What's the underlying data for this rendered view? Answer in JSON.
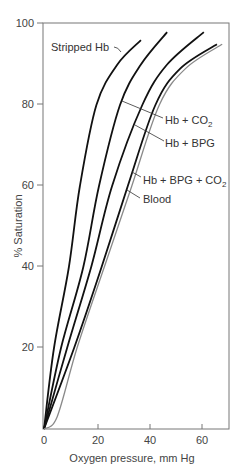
{
  "chart_data": {
    "type": "line",
    "title": "",
    "xlabel": "Oxygen pressure, mm Hg",
    "ylabel": "% Saturation",
    "xlim": [
      0,
      70
    ],
    "ylim": [
      0,
      100
    ],
    "x_ticks": [
      "0",
      "20",
      "40",
      "60"
    ],
    "y_ticks": [
      "20",
      "40",
      "60",
      "80",
      "100"
    ],
    "grid": false,
    "legend": "inline labels",
    "series": [
      {
        "name": "Stripped Hb",
        "color": "#111111",
        "points": [
          [
            0,
            0
          ],
          [
            3.8,
            20
          ],
          [
            9.5,
            40
          ],
          [
            13.7,
            60
          ],
          [
            20,
            80
          ],
          [
            28,
            90
          ],
          [
            37,
            96
          ]
        ]
      },
      {
        "name": "Hb + CO2",
        "color": "#111111",
        "points": [
          [
            0,
            0
          ],
          [
            6.5,
            20
          ],
          [
            15,
            40
          ],
          [
            21,
            60
          ],
          [
            29,
            80
          ],
          [
            37,
            90
          ],
          [
            47,
            98
          ]
        ]
      },
      {
        "name": "Hb + BPG",
        "color": "#111111",
        "points": [
          [
            0,
            0
          ],
          [
            8.8,
            20
          ],
          [
            18,
            40
          ],
          [
            26,
            60
          ],
          [
            37.5,
            80
          ],
          [
            47,
            90
          ],
          [
            61,
            98
          ]
        ]
      },
      {
        "name": "Hb + BPG + CO2",
        "color": "#111111",
        "points": [
          [
            0,
            0
          ],
          [
            11.5,
            20
          ],
          [
            22,
            40
          ],
          [
            32,
            60
          ],
          [
            42.5,
            80
          ],
          [
            52,
            89
          ],
          [
            66,
            95
          ]
        ]
      },
      {
        "name": "Blood",
        "color": "#8a8a8a",
        "points": [
          [
            0,
            0
          ],
          [
            5,
            3
          ],
          [
            12.6,
            20
          ],
          [
            23,
            40
          ],
          [
            33.5,
            60
          ],
          [
            44,
            80
          ],
          [
            54,
            89
          ],
          [
            68,
            95
          ]
        ]
      }
    ]
  },
  "axes": {
    "xlabel": "Oxygen pressure, mm Hg",
    "ylabel": "% Saturation",
    "x_ticks": [
      "0",
      "20",
      "40",
      "60"
    ],
    "y_ticks": [
      "20",
      "40",
      "60",
      "80",
      "100"
    ]
  },
  "labels": {
    "stripped": "Stripped Hb",
    "co2_main": "Hb + CO",
    "co2_sub": "2",
    "bpg": "Hb + BPG",
    "bpg_co2_main": "Hb + BPG + CO",
    "bpg_co2_sub": "2",
    "blood": "Blood"
  }
}
